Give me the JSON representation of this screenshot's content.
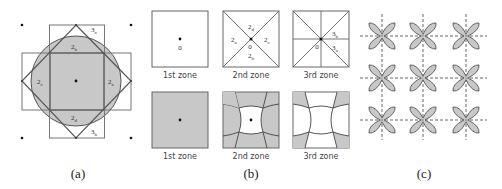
{
  "colors": {
    "fill": "#c8c8c8",
    "stroke": "#555555",
    "light_stroke": "#888888",
    "dash": "#777777"
  },
  "panel_a": {
    "caption": "(a)",
    "labels": {
      "top": "2b",
      "left": "2c",
      "right": "2a",
      "bottom": "2d",
      "top_corner": "3a",
      "bottom_corner": "3b"
    },
    "label_parts": {
      "top": {
        "main": "2",
        "sub": "b"
      },
      "left": {
        "main": "2",
        "sub": "c"
      },
      "right": {
        "main": "2",
        "sub": "a"
      },
      "bottom": {
        "main": "2",
        "sub": "d"
      },
      "top_corner": {
        "main": "3",
        "sub": "a"
      },
      "bottom_corner": {
        "main": "3",
        "sub": "b"
      }
    }
  },
  "panel_b": {
    "caption": "(b)",
    "top_row": [
      {
        "zone_label": "1st zone",
        "center_label": "0"
      },
      {
        "zone_label": "2nd zone",
        "center_label": "0",
        "regions": {
          "top": {
            "main": "2",
            "sub": "d"
          },
          "left": {
            "main": "2",
            "sub": "a"
          },
          "right": {
            "main": "2",
            "sub": "c"
          },
          "bottom": {
            "main": "2",
            "sub": "b"
          }
        }
      },
      {
        "zone_label": "3rd zone",
        "center_label": "0",
        "regions": {
          "upper_right": {
            "main": "3",
            "sub": "b"
          },
          "lower_right": {
            "main": "3",
            "sub": "a"
          }
        }
      }
    ],
    "bottom_row": [
      {
        "zone_label": "1st zone"
      },
      {
        "zone_label": "2nd zone"
      },
      {
        "zone_label": "3rd zone"
      }
    ]
  },
  "panel_c": {
    "caption": "(c)",
    "grid_rows": 3,
    "grid_cols": 3
  }
}
